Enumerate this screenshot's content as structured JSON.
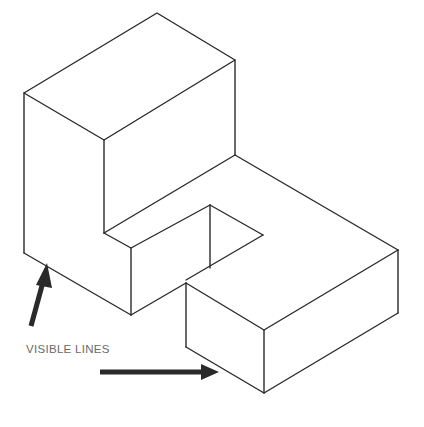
{
  "figure": {
    "type": "isometric-drawing",
    "annotation_label": "VISIBLE LINES",
    "colors": {
      "line": "#2a2a2a",
      "label": "#6a6a6a",
      "background": "#ffffff"
    }
  }
}
